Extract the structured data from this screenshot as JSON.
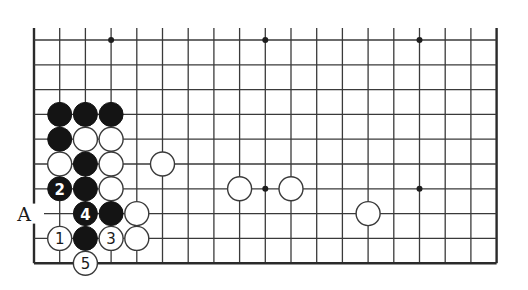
{
  "board": {
    "columns": 19,
    "rows_visible": 10,
    "origin_x": 34,
    "origin_y": 40,
    "spacing_x": 25.7,
    "spacing_y": 24.8,
    "stone_radius": 12,
    "open_top": true,
    "edges": [
      "left",
      "right",
      "bottom"
    ],
    "line_color": "#3a3a3a",
    "star_points": [
      {
        "col": 3,
        "row": 0
      },
      {
        "col": 9,
        "row": 0
      },
      {
        "col": 15,
        "row": 0
      },
      {
        "col": 9,
        "row": 6
      },
      {
        "col": 15,
        "row": 6
      }
    ],
    "stones": [
      {
        "color": "black",
        "col": 1,
        "row": 3,
        "label": ""
      },
      {
        "color": "black",
        "col": 2,
        "row": 3,
        "label": ""
      },
      {
        "color": "black",
        "col": 3,
        "row": 3,
        "label": ""
      },
      {
        "color": "black",
        "col": 1,
        "row": 4,
        "label": ""
      },
      {
        "color": "white",
        "col": 2,
        "row": 4,
        "label": ""
      },
      {
        "color": "white",
        "col": 3,
        "row": 4,
        "label": ""
      },
      {
        "color": "white",
        "col": 1,
        "row": 5,
        "label": ""
      },
      {
        "color": "black",
        "col": 2,
        "row": 5,
        "label": ""
      },
      {
        "color": "white",
        "col": 3,
        "row": 5,
        "label": ""
      },
      {
        "color": "white",
        "col": 5,
        "row": 5,
        "label": ""
      },
      {
        "color": "black",
        "col": 1,
        "row": 6,
        "label": "2"
      },
      {
        "color": "black",
        "col": 2,
        "row": 6,
        "label": ""
      },
      {
        "color": "white",
        "col": 3,
        "row": 6,
        "label": ""
      },
      {
        "color": "white",
        "col": 8,
        "row": 6,
        "label": ""
      },
      {
        "color": "white",
        "col": 10,
        "row": 6,
        "label": ""
      },
      {
        "color": "black",
        "col": 2,
        "row": 7,
        "label": "4"
      },
      {
        "color": "black",
        "col": 3,
        "row": 7,
        "label": ""
      },
      {
        "color": "white",
        "col": 4,
        "row": 7,
        "label": ""
      },
      {
        "color": "white",
        "col": 13,
        "row": 7,
        "label": ""
      },
      {
        "color": "white",
        "col": 1,
        "row": 8,
        "label": "1"
      },
      {
        "color": "black",
        "col": 2,
        "row": 8,
        "label": ""
      },
      {
        "color": "white",
        "col": 3,
        "row": 8,
        "label": "3"
      },
      {
        "color": "white",
        "col": 4,
        "row": 8,
        "label": ""
      },
      {
        "color": "white",
        "col": 2,
        "row": 9,
        "label": "5"
      }
    ],
    "letter_labels": [
      {
        "text": "A",
        "col": 0,
        "row": 7
      }
    ]
  }
}
